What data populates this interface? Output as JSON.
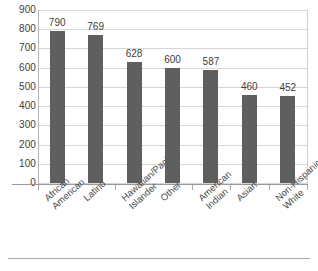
{
  "chart_data": {
    "type": "bar",
    "title": "",
    "subtitle": "",
    "xlabel": "",
    "ylabel": "",
    "ylim": [
      0,
      900
    ],
    "ytick_step": 100,
    "yticks": [
      900,
      800,
      700,
      600,
      500,
      400,
      300,
      200,
      100,
      0
    ],
    "grid": true,
    "legend": null,
    "bar_color": "#5f5f5f",
    "gridline_color": "#d6d6d6",
    "text_color": "#3d3d3d",
    "categories": [
      "African American",
      "Latino",
      "Hawaiian/Pacific Islander",
      "Other",
      "American Indian",
      "Asian",
      "Non-Hispanic White"
    ],
    "category_lines": [
      [
        "African",
        "American"
      ],
      [
        "Latino"
      ],
      [
        "Hawaiian/Pacific",
        "Islander"
      ],
      [
        "Other"
      ],
      [
        "American",
        "Indian"
      ],
      [
        "Asian"
      ],
      [
        "Non-Hispanic",
        "White"
      ]
    ],
    "values": [
      790,
      769,
      628,
      600,
      587,
      460,
      452
    ],
    "value_labels": [
      "790",
      "769",
      "628",
      "600",
      "587",
      "460",
      "452"
    ]
  }
}
